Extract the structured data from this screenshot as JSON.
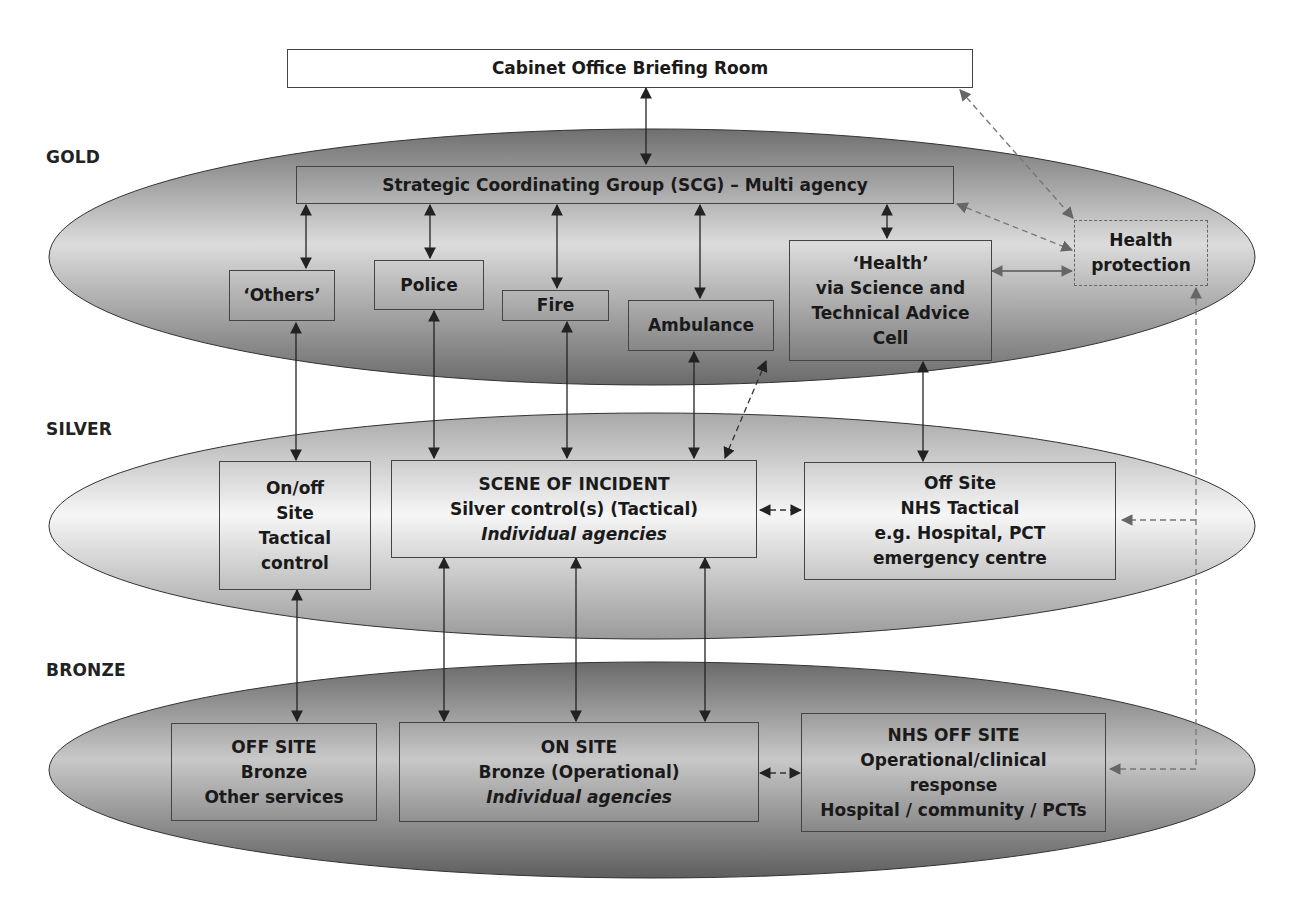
{
  "diagram": {
    "tiers": [
      {
        "id": "gold",
        "label": "GOLD"
      },
      {
        "id": "silver",
        "label": "SILVER"
      },
      {
        "id": "bronze",
        "label": "BRONZE"
      }
    ],
    "top": {
      "cabinet_office": "Cabinet Office Briefing Room"
    },
    "gold": {
      "scg": "Strategic Coordinating Group (SCG) – Multi agency",
      "others": "‘Others’",
      "police": "Police",
      "fire": "Fire",
      "ambulance": "Ambulance",
      "health": {
        "lines": [
          "‘Health’",
          "via Science and",
          "Technical Advice",
          "Cell"
        ]
      },
      "health_protection": {
        "lines": [
          "Health",
          "protection"
        ]
      }
    },
    "silver": {
      "onoff_site": {
        "lines": [
          "On/off",
          "Site",
          "Tactical",
          "control"
        ]
      },
      "scene_of_incident": {
        "lines": [
          "SCENE OF INCIDENT",
          "Silver control(s) (Tactical)",
          "Individual agencies"
        ]
      },
      "off_site_nhs": {
        "lines": [
          "Off Site",
          "NHS Tactical",
          "e.g. Hospital, PCT",
          "emergency centre"
        ]
      }
    },
    "bronze": {
      "off_site": {
        "lines": [
          "OFF SITE",
          "Bronze",
          "Other services"
        ]
      },
      "on_site": {
        "lines": [
          "ON SITE",
          "Bronze (Operational)",
          "Individual agencies"
        ]
      },
      "nhs_off_site": {
        "lines": [
          "NHS OFF SITE",
          "Operational/clinical",
          "response",
          "Hospital / community / PCTs"
        ]
      }
    },
    "colors": {
      "ellipse_dark": "#7a7a7a",
      "ellipse_light": "#e2e2e2",
      "silver_light": "#f4f4f4",
      "line": "#333333",
      "dashed": "#777777"
    }
  }
}
